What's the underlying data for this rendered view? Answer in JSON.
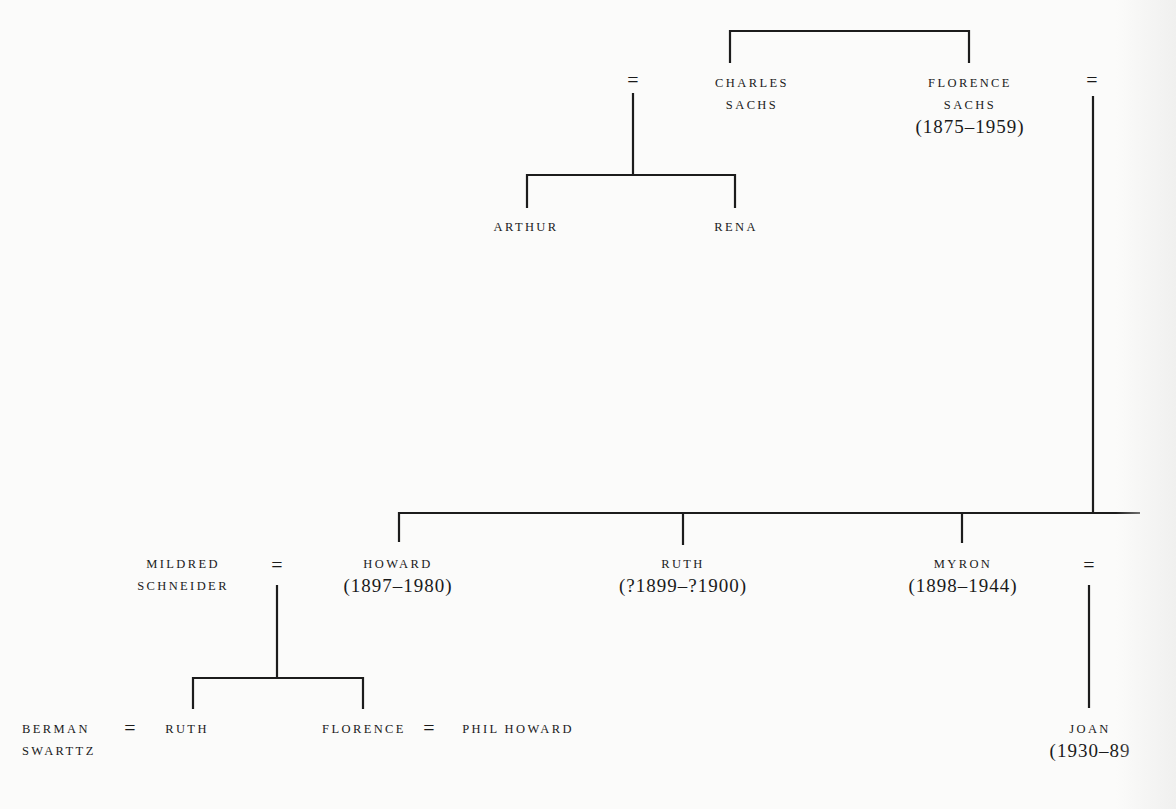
{
  "diagram": {
    "type": "family-tree",
    "people": {
      "charles_sachs": {
        "name_line1": "CHARLES",
        "name_line2": "SACHS"
      },
      "florence_sachs": {
        "name_line1": "FLORENCE",
        "name_line2": "SACHS",
        "dates": "(1875–1959)"
      },
      "arthur": {
        "name": "ARTHUR"
      },
      "rena": {
        "name": "RENA"
      },
      "mildred_schneider": {
        "name_line1": "MILDRED",
        "name_line2": "SCHNEIDER"
      },
      "howard": {
        "name": "HOWARD",
        "dates": "(1897–1980)"
      },
      "ruth_1899": {
        "name": "RUTH",
        "dates": "(?1899–?1900)"
      },
      "myron": {
        "name": "MYRON",
        "dates": "(1898–1944)"
      },
      "berman_swarttz": {
        "name_line1": "BERMAN",
        "name_line2": "SWARTTZ"
      },
      "ruth": {
        "name": "RUTH"
      },
      "florence": {
        "name": "FLORENCE"
      },
      "phil_howard": {
        "name": "PHIL HOWARD"
      },
      "joan": {
        "name": "JOAN",
        "dates": "(1930–89"
      }
    },
    "marriage_symbol": "=",
    "relations": [
      {
        "type": "siblings",
        "members": [
          "charles_sachs",
          "florence_sachs"
        ]
      },
      {
        "type": "marriage",
        "members": [
          "?",
          "charles_sachs"
        ]
      },
      {
        "type": "children",
        "parents": "charles_sachs",
        "children": [
          "arthur",
          "rena"
        ]
      },
      {
        "type": "marriage",
        "members": [
          "florence_sachs",
          "?"
        ]
      },
      {
        "type": "children",
        "parents": "florence_sachs",
        "children": [
          "howard",
          "ruth_1899",
          "myron"
        ]
      },
      {
        "type": "marriage",
        "members": [
          "mildred_schneider",
          "howard"
        ]
      },
      {
        "type": "children",
        "parents": "howard",
        "children": [
          "ruth",
          "florence"
        ]
      },
      {
        "type": "marriage",
        "members": [
          "berman_swarttz",
          "ruth"
        ]
      },
      {
        "type": "marriage",
        "members": [
          "florence",
          "phil_howard"
        ]
      },
      {
        "type": "marriage",
        "members": [
          "myron",
          "?"
        ]
      },
      {
        "type": "children",
        "parents": "myron",
        "children": [
          "joan"
        ]
      }
    ]
  }
}
